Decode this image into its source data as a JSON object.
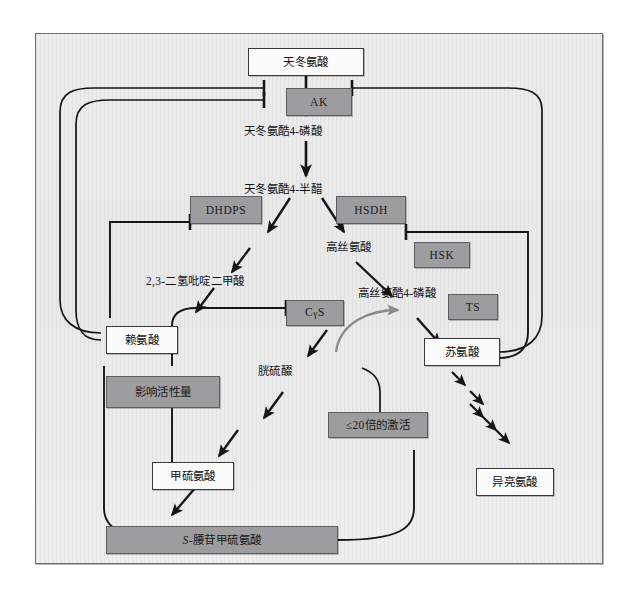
{
  "diagram": {
    "type": "metabolic-pathway",
    "colors": {
      "paper": "#ebebec",
      "enzyme_fill": "#9d9d9f",
      "metabolite_fill": "#fbfbfb",
      "line": "#1c1c1e",
      "activation_arrow": "#8a8a8c",
      "frame_border": "#6f6f72"
    },
    "metabolites": [
      {
        "id": "aspartate",
        "label": "天冬氨酸"
      },
      {
        "id": "lysine",
        "label": "赖氨酸"
      },
      {
        "id": "threonine",
        "label": "苏氨酸"
      },
      {
        "id": "methionine",
        "label": "甲硫氨酸"
      },
      {
        "id": "isoleucine",
        "label": "异亮氨酸"
      },
      {
        "id": "sam",
        "label": "S-腰苷甲硫氨酸",
        "italic_prefix": "S-"
      }
    ],
    "intermediates": [
      {
        "id": "asp4p",
        "label": "天冬氨酷4-磷酸"
      },
      {
        "id": "asa",
        "label": "天冬氨酷4-半醋"
      },
      {
        "id": "dhdp",
        "label": "2,3-二氢吡啶二甲酸"
      },
      {
        "id": "homoserine",
        "label": "高丝氨酸"
      },
      {
        "id": "hsp",
        "label": "高丝氨酷4-磷酸"
      },
      {
        "id": "cystathionine",
        "label": "胱硫醊"
      }
    ],
    "enzymes": [
      {
        "id": "ak",
        "label": "AK"
      },
      {
        "id": "dhdps",
        "label": "DHDPS"
      },
      {
        "id": "hsdh",
        "label": "HSDH"
      },
      {
        "id": "hsk",
        "label": "HSK"
      },
      {
        "id": "ts",
        "label": "TS"
      },
      {
        "id": "cgs",
        "label": "CγS",
        "base": "C",
        "greek": "γ",
        "suffix": "S"
      }
    ],
    "annotations": [
      {
        "id": "activity-amount",
        "label": "影响活性量",
        "style": "gray-box"
      },
      {
        "id": "activation-fold",
        "label": "≤20倍的激活",
        "style": "gray-box"
      }
    ],
    "edges": [
      {
        "from": "aspartate",
        "to": "asp4p",
        "kind": "arrow"
      },
      {
        "from": "asp4p",
        "to": "asa",
        "kind": "arrow"
      },
      {
        "from": "asa",
        "to": "dhdp",
        "kind": "multi-step-arrow"
      },
      {
        "from": "asa",
        "to": "homoserine",
        "kind": "arrow"
      },
      {
        "from": "dhdp",
        "to": "lysine",
        "kind": "multi-step-arrow"
      },
      {
        "from": "homoserine",
        "to": "hsp",
        "kind": "arrow"
      },
      {
        "from": "hsp",
        "to": "threonine",
        "kind": "arrow"
      },
      {
        "from": "homoserine",
        "to": "cystathionine",
        "kind": "arrow"
      },
      {
        "from": "cystathionine",
        "to": "methionine",
        "kind": "multi-step-arrow"
      },
      {
        "from": "methionine",
        "to": "sam",
        "kind": "arrow"
      },
      {
        "from": "threonine",
        "to": "isoleucine",
        "kind": "multi-step-arrow"
      },
      {
        "from": "lysine",
        "to": "ak",
        "kind": "inhibition"
      },
      {
        "from": "threonine",
        "to": "ak",
        "kind": "inhibition"
      },
      {
        "from": "lysine",
        "to": "dhdps",
        "kind": "inhibition"
      },
      {
        "from": "threonine",
        "to": "hsdh",
        "kind": "inhibition"
      },
      {
        "from": "sam",
        "to": "cgs",
        "kind": "inhibition"
      },
      {
        "from": "sam",
        "to": "ts",
        "kind": "activation"
      }
    ]
  }
}
